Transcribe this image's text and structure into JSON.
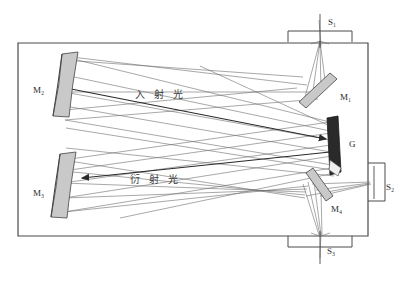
{
  "diagram": {
    "housing": {
      "name": "spectrometer-housing"
    },
    "colors": {
      "outline": "#4a4a4a",
      "ray": "#6d6d6d",
      "beam": "#3a3a3a",
      "mirror_face": "#c9c9c9",
      "mirror_edge": "#555555",
      "grating": "#2a2a2a",
      "label": "#2b2b2b"
    },
    "ports": [
      {
        "id": "port-top",
        "slit": "S",
        "slit_sub": "1",
        "label": "S₁"
      },
      {
        "id": "port-right",
        "slit": "S",
        "slit_sub": "2",
        "label": "S₂"
      },
      {
        "id": "port-bottom",
        "slit": "S",
        "slit_sub": "3",
        "label": "S₃"
      }
    ],
    "mirrors": [
      {
        "id": "mirror-m1",
        "base": "M",
        "sub": "1",
        "label": "M₁",
        "kind": "flat",
        "position": "upper-right"
      },
      {
        "id": "mirror-m2",
        "base": "M",
        "sub": "2",
        "label": "M₂",
        "kind": "concave",
        "position": "upper-left"
      },
      {
        "id": "mirror-m3",
        "base": "M",
        "sub": "3",
        "label": "M₃",
        "kind": "concave",
        "position": "lower-left"
      },
      {
        "id": "mirror-m4",
        "base": "M",
        "sub": "4",
        "label": "M₄",
        "kind": "flat",
        "position": "lower-right"
      }
    ],
    "grating": {
      "id": "grating-g",
      "label": "G",
      "position": "right-center"
    },
    "beams": [
      {
        "id": "beam-incident",
        "label": "入 射 光",
        "meaning": "incident light",
        "direction": "right"
      },
      {
        "id": "beam-diffracted",
        "label": "衍 射 光",
        "meaning": "diffracted light",
        "direction": "left"
      }
    ],
    "labels": {
      "m1": "M₁",
      "m2": "M₂",
      "m3": "M₃",
      "m4": "M₄",
      "g": "G",
      "s1": "S₁",
      "s2": "S₂",
      "s3": "S₃",
      "incident": "入 射 光",
      "diffracted": "衍 射 光"
    }
  }
}
